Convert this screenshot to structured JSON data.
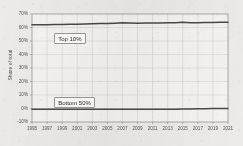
{
  "chart_data": {
    "type": "line",
    "title": "",
    "subtitle": "",
    "xlabel": "",
    "ylabel": "Share of total",
    "xlim": [
      1995,
      2021
    ],
    "ylim": [
      -10,
      70
    ],
    "grid": true,
    "legend_position": "inline-callouts",
    "y_tick_labels": [
      "70%",
      "60%",
      "50%",
      "40%",
      "30%",
      "20%",
      "10%",
      "0%",
      "-10%"
    ],
    "y_tick_values": [
      70,
      60,
      50,
      40,
      30,
      20,
      10,
      0,
      -10
    ],
    "x_tick_labels": [
      "1995",
      "1997",
      "1999",
      "2001",
      "2003",
      "2005",
      "2007",
      "2009",
      "2011",
      "2013",
      "2015",
      "2017",
      "2019",
      "2021"
    ],
    "x_tick_values": [
      1995,
      1997,
      1999,
      2001,
      2003,
      2005,
      2007,
      2009,
      2011,
      2013,
      2015,
      2017,
      2019,
      2021
    ],
    "x": [
      1995,
      1996,
      1997,
      1998,
      1999,
      2000,
      2001,
      2002,
      2003,
      2004,
      2005,
      2006,
      2007,
      2008,
      2009,
      2010,
      2011,
      2012,
      2013,
      2014,
      2015,
      2016,
      2017,
      2018,
      2019,
      2020,
      2021
    ],
    "series": [
      {
        "name": "Top 10%",
        "color": "#4a4845",
        "values": [
          62.0,
          62.0,
          62.1,
          62.2,
          62.3,
          62.4,
          62.5,
          62.6,
          62.7,
          62.9,
          63.0,
          63.2,
          63.5,
          63.3,
          63.2,
          63.3,
          63.4,
          63.4,
          63.5,
          63.6,
          63.9,
          63.6,
          63.6,
          63.7,
          63.7,
          63.8,
          63.9
        ]
      },
      {
        "name": "Bottom 50%",
        "color": "#4a4845",
        "values": [
          -0.6,
          -0.6,
          -0.6,
          -0.6,
          -0.6,
          -0.6,
          -0.6,
          -0.6,
          -0.6,
          -0.6,
          -0.6,
          -0.6,
          -0.6,
          -0.6,
          -0.6,
          -0.6,
          -0.6,
          -0.6,
          -0.6,
          -0.5,
          -0.4,
          -0.3,
          -0.2,
          -0.1,
          0.0,
          0.0,
          0.0
        ]
      }
    ],
    "annotations": [
      {
        "label": "Top 10%"
      },
      {
        "label": "Bottom 50%"
      }
    ],
    "colors": {
      "background": "#ecebe9",
      "plot_background": "#f4f3f1",
      "grid": "#cfcdc8",
      "axis": "#8d8b86",
      "line": "#4a4845",
      "text": "#55534f"
    }
  }
}
